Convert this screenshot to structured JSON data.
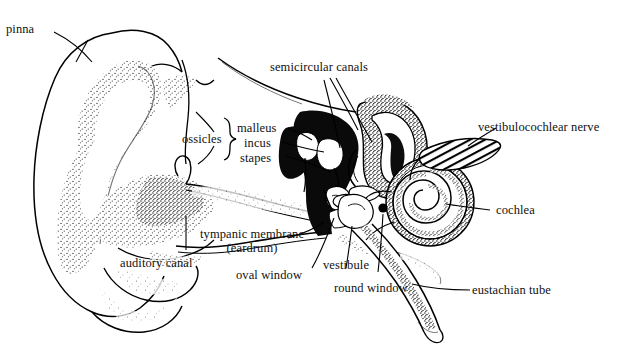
{
  "figure": {
    "background_color": "#ffffff",
    "ink_color": "#000000"
  },
  "labels": {
    "pinna": "pinna",
    "semicircular_canals": "semicircular canals",
    "ossicles": "ossicles",
    "malleus": "malleus",
    "incus": "incus",
    "stapes": "stapes",
    "vestibulocochlear_nerve": "vestibulocochlear nerve",
    "cochlea": "cochlea",
    "tympanic_membrane_line1": "tympanic membrane",
    "tympanic_membrane_line2": "(eardrum)",
    "auditory_canal": "auditory canal",
    "oval_window": "oval window",
    "vestibule": "vestibule",
    "round_window": "round window",
    "eustachian_tube": "eustachian tube"
  },
  "parts": [
    {
      "name": "pinna",
      "region": "outer ear"
    },
    {
      "name": "auditory canal",
      "region": "outer ear"
    },
    {
      "name": "tympanic membrane (eardrum)",
      "region": "middle ear"
    },
    {
      "name": "malleus",
      "region": "middle ear"
    },
    {
      "name": "incus",
      "region": "middle ear"
    },
    {
      "name": "stapes",
      "region": "middle ear"
    },
    {
      "name": "oval window",
      "region": "middle ear"
    },
    {
      "name": "round window",
      "region": "middle ear"
    },
    {
      "name": "eustachian tube",
      "region": "middle ear"
    },
    {
      "name": "semicircular canals",
      "region": "inner ear"
    },
    {
      "name": "vestibule",
      "region": "inner ear"
    },
    {
      "name": "cochlea",
      "region": "inner ear"
    },
    {
      "name": "vestibulocochlear nerve",
      "region": "inner ear"
    }
  ]
}
